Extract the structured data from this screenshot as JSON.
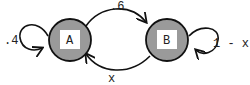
{
  "diagram": {
    "type": "markov-chain",
    "colors": {
      "state_fill": "#9a9a9a",
      "state_stroke": "#111111",
      "label_box": "#ffffff",
      "edge": "#111111"
    },
    "states": [
      {
        "id": "A",
        "label": "A"
      },
      {
        "id": "B",
        "label": "B"
      }
    ],
    "transitions": [
      {
        "from": "A",
        "to": "A",
        "label": ".4"
      },
      {
        "from": "A",
        "to": "B",
        "label": ".6"
      },
      {
        "from": "B",
        "to": "A",
        "label": "x"
      },
      {
        "from": "B",
        "to": "B",
        "label": "1 - x"
      }
    ]
  }
}
